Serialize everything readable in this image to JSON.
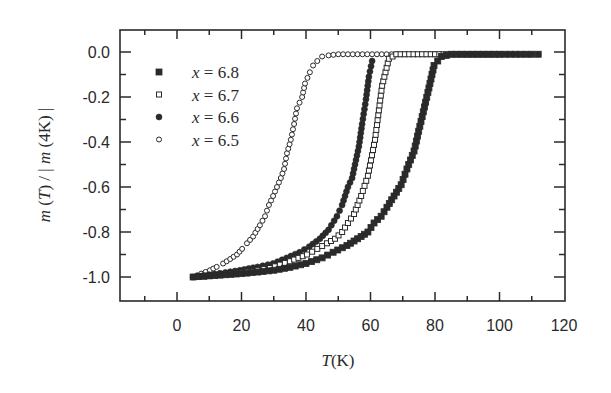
{
  "chart_data": {
    "type": "scatter",
    "title": "",
    "xlabel": "T (K)",
    "xlabel_parts": {
      "var": "T",
      "unit": "(K)"
    },
    "ylabel": "m (T) / | m (4K) |",
    "xlim": [
      -18,
      120
    ],
    "ylim": [
      -1.1,
      0.1
    ],
    "x_ticks": [
      0,
      20,
      40,
      60,
      80,
      100,
      120
    ],
    "x_tick_labels": [
      "0",
      "20",
      "40",
      "60",
      "80",
      "100",
      "120"
    ],
    "y_ticks": [
      0.0,
      -0.2,
      -0.4,
      -0.6,
      -0.8,
      -1.0
    ],
    "y_tick_labels": [
      "0.0",
      "-0.2",
      "-0.4",
      "-0.6",
      "-0.8",
      "-1.0"
    ],
    "grid": false,
    "legend_position": "upper left",
    "legend": [
      {
        "label": "x = 6.8",
        "var": "x",
        "value": "= 6.8",
        "marker": "filled-square"
      },
      {
        "label": "x = 6.7",
        "var": "x",
        "value": "= 6.7",
        "marker": "open-square"
      },
      {
        "label": "x = 6.6",
        "var": "x",
        "value": "= 6.6",
        "marker": "filled-circle"
      },
      {
        "label": "x = 6.5",
        "var": "x",
        "value": "= 6.5",
        "marker": "open-circle"
      }
    ],
    "series": [
      {
        "name": "x = 6.8",
        "marker": "filled-square",
        "points": [
          [
            5,
            -1.0
          ],
          [
            10,
            -0.995
          ],
          [
            15,
            -0.99
          ],
          [
            20,
            -0.985
          ],
          [
            25,
            -0.978
          ],
          [
            30,
            -0.97
          ],
          [
            35,
            -0.957
          ],
          [
            40,
            -0.94
          ],
          [
            45,
            -0.915
          ],
          [
            48.4,
            -0.89
          ],
          [
            52.7,
            -0.86
          ],
          [
            54.9,
            -0.84
          ],
          [
            57.1,
            -0.82
          ],
          [
            59.2,
            -0.8
          ],
          [
            61.1,
            -0.76
          ],
          [
            63.3,
            -0.73
          ],
          [
            65.1,
            -0.69
          ],
          [
            67.3,
            -0.64
          ],
          [
            69.5,
            -0.59
          ],
          [
            71.3,
            -0.52
          ],
          [
            73.5,
            -0.44
          ],
          [
            75.3,
            -0.33
          ],
          [
            77.8,
            -0.18
          ],
          [
            79.7,
            -0.06
          ],
          [
            82,
            -0.02
          ],
          [
            85,
            -0.01
          ],
          [
            90,
            -0.01
          ],
          [
            95,
            -0.01
          ],
          [
            100,
            -0.01
          ],
          [
            105,
            -0.01
          ],
          [
            110,
            -0.01
          ],
          [
            112,
            -0.01
          ]
        ]
      },
      {
        "name": "x = 6.7",
        "marker": "open-square",
        "points": [
          [
            5,
            -1.0
          ],
          [
            10,
            -0.995
          ],
          [
            15,
            -0.988
          ],
          [
            20,
            -0.98
          ],
          [
            25,
            -0.97
          ],
          [
            28.8,
            -0.96
          ],
          [
            35,
            -0.93
          ],
          [
            40.3,
            -0.9
          ],
          [
            43.5,
            -0.875
          ],
          [
            46.5,
            -0.85
          ],
          [
            49,
            -0.83
          ],
          [
            51.2,
            -0.8
          ],
          [
            53,
            -0.76
          ],
          [
            54.9,
            -0.72
          ],
          [
            57.1,
            -0.64
          ],
          [
            59.2,
            -0.55
          ],
          [
            61.4,
            -0.39
          ],
          [
            63.6,
            -0.15
          ],
          [
            65.7,
            -0.03
          ],
          [
            68,
            -0.01
          ],
          [
            72,
            -0.01
          ],
          [
            76,
            -0.01
          ],
          [
            80,
            -0.01
          ],
          [
            84,
            -0.01
          ],
          [
            88,
            -0.01
          ],
          [
            92,
            -0.01
          ],
          [
            96,
            -0.01
          ],
          [
            100,
            -0.01
          ]
        ]
      },
      {
        "name": "x = 6.6",
        "marker": "filled-circle",
        "points": [
          [
            5,
            -1.0
          ],
          [
            10,
            -0.99
          ],
          [
            15,
            -0.98
          ],
          [
            19.5,
            -0.97
          ],
          [
            25,
            -0.955
          ],
          [
            29.8,
            -0.94
          ],
          [
            34,
            -0.915
          ],
          [
            38,
            -0.89
          ],
          [
            41,
            -0.865
          ],
          [
            44.3,
            -0.83
          ],
          [
            47,
            -0.79
          ],
          [
            49.6,
            -0.73
          ],
          [
            51.2,
            -0.68
          ],
          [
            52.1,
            -0.64
          ],
          [
            53,
            -0.6
          ],
          [
            54.3,
            -0.56
          ],
          [
            55.2,
            -0.5
          ],
          [
            56.4,
            -0.42
          ],
          [
            57.4,
            -0.32
          ],
          [
            58.6,
            -0.21
          ],
          [
            59.5,
            -0.11
          ],
          [
            60.5,
            -0.04
          ]
        ]
      },
      {
        "name": "x = 6.5",
        "marker": "open-circle",
        "points": [
          [
            5,
            -1.0
          ],
          [
            7.5,
            -0.985
          ],
          [
            10.2,
            -0.97
          ],
          [
            12.3,
            -0.955
          ],
          [
            14.3,
            -0.94
          ],
          [
            16.5,
            -0.92
          ],
          [
            18.6,
            -0.9
          ],
          [
            20.2,
            -0.875
          ],
          [
            21.7,
            -0.85
          ],
          [
            23.6,
            -0.82
          ],
          [
            25.7,
            -0.77
          ],
          [
            27.3,
            -0.73
          ],
          [
            28.5,
            -0.68
          ],
          [
            29.8,
            -0.64
          ],
          [
            31,
            -0.6
          ],
          [
            32.2,
            -0.56
          ],
          [
            33.2,
            -0.52
          ],
          [
            34.1,
            -0.45
          ],
          [
            35.3,
            -0.39
          ],
          [
            36.3,
            -0.32
          ],
          [
            37.2,
            -0.25
          ],
          [
            38.8,
            -0.2
          ],
          [
            39.7,
            -0.14
          ],
          [
            41.2,
            -0.09
          ],
          [
            42.2,
            -0.06
          ],
          [
            43.5,
            -0.04
          ],
          [
            45,
            -0.02
          ],
          [
            47,
            -0.015
          ],
          [
            50,
            -0.01
          ],
          [
            53,
            -0.01
          ],
          [
            56,
            -0.01
          ],
          [
            59,
            -0.01
          ],
          [
            62,
            -0.01
          ],
          [
            65,
            -0.01
          ],
          [
            68,
            -0.01
          ],
          [
            71,
            -0.01
          ],
          [
            74,
            -0.01
          ],
          [
            77,
            -0.01
          ],
          [
            80,
            -0.01
          ],
          [
            83,
            -0.01
          ],
          [
            86,
            -0.01
          ],
          [
            89,
            -0.01
          ],
          [
            92,
            -0.01
          ],
          [
            95,
            -0.01
          ],
          [
            98,
            -0.01
          ],
          [
            101,
            -0.01
          ],
          [
            104,
            -0.01
          ],
          [
            107,
            -0.01
          ],
          [
            110,
            -0.01
          ],
          [
            112,
            -0.01
          ]
        ]
      }
    ]
  },
  "colors": {
    "ink": "#2a2a2a",
    "background": "#ffffff"
  }
}
